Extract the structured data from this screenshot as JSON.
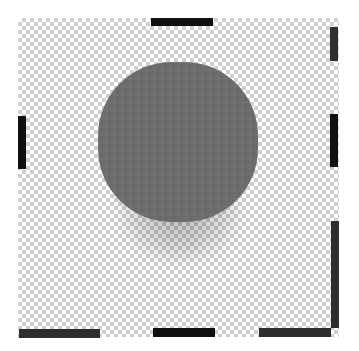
{
  "canvas": {
    "background": "transparent-checkerboard",
    "checker_light": "#ffffff",
    "checker_dark": "#cfcfcf"
  },
  "shape": {
    "type": "rounded-square-blob",
    "fill": "#6b6b6b",
    "shadow": true
  },
  "handles": [
    {
      "name": "top-center",
      "color": "#111111"
    },
    {
      "name": "left-middle",
      "color": "#111111"
    },
    {
      "name": "right-top",
      "color": "#2e2e2e"
    },
    {
      "name": "right-middle",
      "color": "#111111"
    },
    {
      "name": "right-bottom",
      "color": "#2e2e2e"
    },
    {
      "name": "bottom-left",
      "color": "#2e2e2e"
    },
    {
      "name": "bottom-center",
      "color": "#111111"
    },
    {
      "name": "bottom-right",
      "color": "#2e2e2e"
    }
  ]
}
